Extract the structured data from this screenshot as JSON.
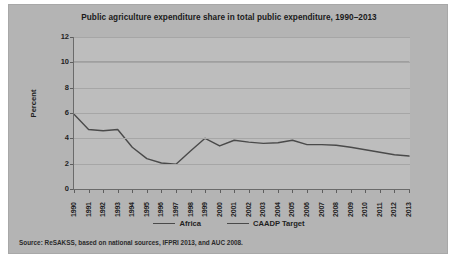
{
  "chart_data": {
    "type": "line",
    "title": "Public agriculture expenditure share in total public expenditure, 1990–2013",
    "xlabel": "",
    "ylabel": "Percent",
    "ylim": [
      0,
      12
    ],
    "yticks": [
      0,
      2,
      4,
      6,
      8,
      10,
      12
    ],
    "grid": true,
    "legend_position": "bottom",
    "x": [
      1990,
      1991,
      1992,
      1993,
      1994,
      1995,
      1996,
      1997,
      1998,
      1999,
      2000,
      2001,
      2002,
      2003,
      2004,
      2005,
      2006,
      2007,
      2008,
      2009,
      2010,
      2011,
      2012,
      2013
    ],
    "categories": [
      "1990",
      "1991",
      "1992",
      "1993",
      "1994",
      "1995",
      "1996",
      "1997",
      "1998",
      "1999",
      "2000",
      "2001",
      "2002",
      "2003",
      "2004",
      "2005",
      "2006",
      "2007",
      "2008",
      "2009",
      "2010",
      "2011",
      "2012",
      "2013"
    ],
    "series": [
      {
        "name": "Africa",
        "color": "#4a4a4a",
        "values": [
          5.9,
          4.7,
          4.6,
          4.7,
          3.3,
          2.4,
          2.05,
          1.95,
          3.0,
          4.0,
          3.4,
          3.85,
          3.7,
          3.6,
          3.65,
          3.85,
          3.5,
          3.5,
          3.45,
          3.3,
          3.1,
          2.9,
          2.7,
          2.6
        ]
      },
      {
        "name": "CAADP Target",
        "color": "#4a4a4a",
        "values": [
          10,
          10,
          10,
          10,
          10,
          10,
          10,
          10,
          10,
          10,
          10,
          10,
          10,
          10,
          10,
          10,
          10,
          10,
          10,
          10,
          10,
          10,
          10,
          10
        ]
      }
    ],
    "source_note": "Source: ReSAKSS, based on national sources, IFPRI 2013, and AUC 2008."
  },
  "legend": {
    "items": [
      {
        "label": "Africa"
      },
      {
        "label": "CAADP Target"
      }
    ]
  },
  "colors": {
    "panel_background": "#b4b4b4",
    "plot_background": "#bdbdbd",
    "line": "#4a4a4a",
    "gridline": "#a6a6a6",
    "axis": "#6b6b6b",
    "text": "#1f1f1f"
  }
}
